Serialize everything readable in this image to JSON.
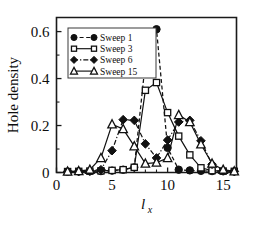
{
  "chart_data": {
    "type": "line",
    "title": "",
    "xlabel": "l_x",
    "xlabel_main": "l",
    "xlabel_sub": "x",
    "ylabel": "Hole density",
    "xlim": [
      0,
      16.2
    ],
    "ylim": [
      0,
      0.66
    ],
    "grid": false,
    "legend_position": "top-left-inside",
    "x_ticks": [
      0,
      5,
      10,
      15
    ],
    "x_tick_labels": [
      "0",
      "5",
      "10",
      "15"
    ],
    "x_minor_ticks": [
      1,
      2,
      3,
      4,
      6,
      7,
      8,
      9,
      11,
      12,
      13,
      14,
      16
    ],
    "y_ticks": [
      0,
      0.2,
      0.4,
      0.6
    ],
    "y_tick_labels": [
      "0",
      "0.2",
      "0.4",
      "0.6"
    ],
    "y_minor_ticks": [
      0.1,
      0.3,
      0.5
    ],
    "x": [
      1,
      2,
      3,
      4,
      5,
      6,
      7,
      8,
      9,
      10,
      11,
      12,
      13,
      14,
      15,
      16
    ],
    "series": [
      {
        "name": "Sweep 1",
        "marker": "filled-circle",
        "line_style": "dashed",
        "values": [
          0.003,
          0.004,
          0.005,
          0.006,
          0.008,
          0.012,
          0.022,
          0.47,
          0.61,
          0.105,
          0.012,
          0.009,
          0.007,
          0.006,
          0.005,
          0.004
        ]
      },
      {
        "name": "Sweep 3",
        "marker": "open-square",
        "line_style": "solid",
        "values": [
          0.004,
          0.005,
          0.006,
          0.007,
          0.009,
          0.012,
          0.022,
          0.35,
          0.383,
          0.255,
          0.155,
          0.075,
          0.02,
          0.008,
          0.006,
          0.005
        ]
      },
      {
        "name": "Sweep 6",
        "marker": "filled-diamond",
        "line_style": "dash-dot",
        "values": [
          0.004,
          0.005,
          0.006,
          0.012,
          0.093,
          0.225,
          0.222,
          0.122,
          0.062,
          0.138,
          0.215,
          0.222,
          0.135,
          0.035,
          0.008,
          0.005
        ]
      },
      {
        "name": "Sweep 15",
        "marker": "open-triangle",
        "line_style": "solid",
        "values": [
          0.004,
          0.006,
          0.012,
          0.062,
          0.205,
          0.185,
          0.112,
          0.038,
          0.042,
          0.062,
          0.245,
          0.215,
          0.12,
          0.038,
          0.012,
          0.005
        ]
      }
    ]
  },
  "legend": {
    "entries": [
      {
        "label": "Sweep 1"
      },
      {
        "label": "Sweep 3"
      },
      {
        "label": "Sweep 6"
      },
      {
        "label": "Sweep 15"
      }
    ]
  },
  "colors": {
    "ink": "#111111",
    "background": "#ffffff"
  }
}
